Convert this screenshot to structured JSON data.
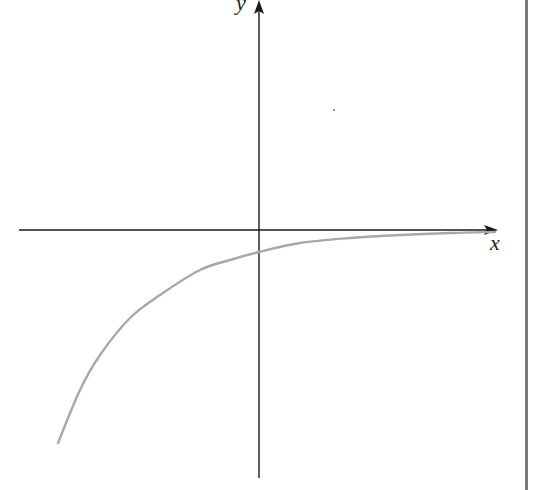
{
  "figure": {
    "x_axis_label": "x",
    "y_axis_label": "y",
    "colors": {
      "axes": "#1a1a1a",
      "curve": "#a8a8a8",
      "border": "#7a7a7a"
    }
  },
  "chart_data": {
    "type": "line",
    "title": "",
    "xlabel": "x",
    "ylabel": "y",
    "grid": false,
    "legend": null,
    "series": [
      {
        "name": "curve",
        "pixel_points": [
          [
            58,
            443
          ],
          [
            80,
            390
          ],
          [
            100,
            355
          ],
          [
            130,
            318
          ],
          [
            160,
            295
          ],
          [
            200,
            270
          ],
          [
            230,
            260
          ],
          [
            259,
            252
          ],
          [
            300,
            243
          ],
          [
            350,
            238
          ],
          [
            400,
            235
          ],
          [
            450,
            233
          ],
          [
            495,
            232
          ]
        ]
      }
    ],
    "axes_pixel": {
      "origin": [
        259,
        230
      ],
      "x_axis": {
        "from": 19,
        "to": 498
      },
      "y_axis": {
        "from": 2,
        "to": 478
      }
    }
  }
}
